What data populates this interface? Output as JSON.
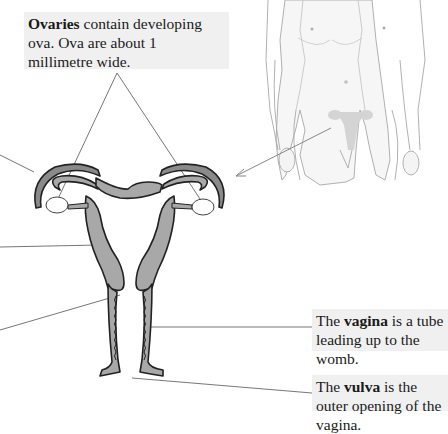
{
  "labels": {
    "ovaries": {
      "bold": "Ovaries",
      "rest": " contain developing ova. Ova are about 1 millimetre wide."
    },
    "vagina": {
      "prefix": "The ",
      "bold": "vagina",
      "rest": " is a tube leading up to the womb."
    },
    "vulva": {
      "prefix": "The ",
      "bold": "vulva",
      "rest": " is the outer opening of the vagina."
    }
  },
  "colors": {
    "label_bg": "#f0f0f0",
    "organ_fill": "#a8a8a8",
    "outline": "#222222",
    "leader_line": "#666666",
    "body_skin": "#f4f4f4",
    "body_outline": "#9a9a9a"
  }
}
